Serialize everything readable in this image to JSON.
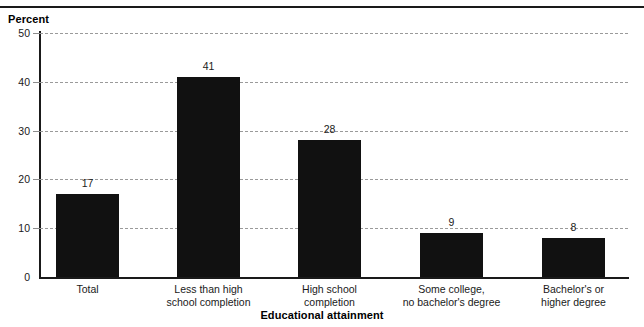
{
  "chart_data": {
    "type": "bar",
    "title": "",
    "subtitle": "",
    "xlabel": "Educational attainment",
    "ylabel": "Percent",
    "categories": [
      "Total",
      "Less than high school completion",
      "High school completion",
      "Some college, no bachelor's degree",
      "Bachelor's or higher degree"
    ],
    "category_lines": [
      [
        "Total"
      ],
      [
        "Less than high",
        "school completion"
      ],
      [
        "High school",
        "completion"
      ],
      [
        "Some college,",
        "no bachelor's degree"
      ],
      [
        "Bachelor's or",
        "higher degree"
      ]
    ],
    "values": [
      17,
      41,
      28,
      9,
      8
    ],
    "value_labels": [
      "17",
      "41",
      "28",
      "9",
      "8"
    ],
    "ylim": [
      0,
      50
    ],
    "yticks": [
      0,
      10,
      20,
      30,
      40,
      50
    ],
    "ytick_labels": [
      "0",
      "10",
      "20",
      "30",
      "40",
      "50"
    ],
    "grid": true,
    "grid_style": "dashed-horizontal",
    "legend": "none",
    "bar_color": "#111111",
    "grid_color": "#9a9a9a",
    "axis_color": "#1a1a1a"
  },
  "axes": {
    "y_title": "Percent",
    "x_title": "Educational attainment"
  }
}
